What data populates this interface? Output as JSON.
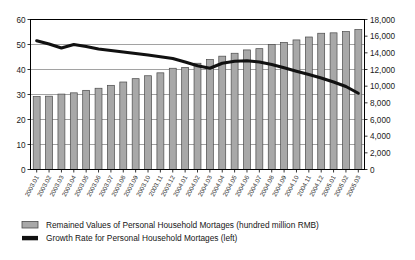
{
  "chart_data": {
    "type": "bar",
    "title": "",
    "subtitle": "",
    "xlabel": "",
    "ylabel": "",
    "grid": true,
    "legend_position": "bottom-left",
    "categories": [
      "2003.01",
      "2003.02",
      "2003.03",
      "2003.04",
      "2003.05",
      "2003.06",
      "2003.07",
      "2003.08",
      "2003.09",
      "2003.10",
      "2003.11",
      "2003.12",
      "2004.01",
      "2004.02",
      "2004.03",
      "2004.04",
      "2004.05",
      "2004.06",
      "2004.07",
      "2004.08",
      "2004.09",
      "2004.10",
      "2004.11",
      "2004.12",
      "2005.01",
      "2005.02",
      "2005.03"
    ],
    "left_axis": {
      "label": "",
      "ticks": [
        "0",
        "10",
        "20",
        "30",
        "40",
        "50",
        "60"
      ],
      "tick_values": [
        0,
        10,
        20,
        30,
        40,
        50,
        60
      ],
      "ylim": [
        0,
        60
      ]
    },
    "right_axis": {
      "label": "",
      "ticks": [
        "0",
        "2,000",
        "4,000",
        "6,000",
        "8,000",
        "10,000",
        "12,000",
        "14,000",
        "16,000",
        "18,000"
      ],
      "tick_values": [
        0,
        2000,
        4000,
        6000,
        8000,
        10000,
        12000,
        14000,
        16000,
        18000
      ],
      "ylim": [
        0,
        18000
      ]
    },
    "series": [
      {
        "name": "Remained Values of Personal Household Mortages (hundred million RMB)",
        "type": "bar",
        "axis": "right",
        "color": "#a8a8a8",
        "edge_color": "#4a4a4a",
        "values": [
          8750,
          8800,
          9050,
          9200,
          9500,
          9750,
          10100,
          10500,
          10900,
          11250,
          11600,
          12150,
          12250,
          12750,
          13200,
          13600,
          13950,
          14350,
          14500,
          15000,
          15250,
          15550,
          15900,
          16350,
          16400,
          16550,
          16800
        ]
      },
      {
        "name": "Growth Rate for Personal Household Mortages (left)",
        "type": "line",
        "axis": "left",
        "color": "#111111",
        "values": [
          51.5,
          50.2,
          48.6,
          50.0,
          49.2,
          48.2,
          47.6,
          47.0,
          46.4,
          45.8,
          45.1,
          44.4,
          43.0,
          41.5,
          40.5,
          42.5,
          43.3,
          43.5,
          43.0,
          42.0,
          40.7,
          39.3,
          38.0,
          36.6,
          35.0,
          33.2,
          30.5
        ]
      }
    ]
  },
  "legend": {
    "items": [
      {
        "label": "Remained Values of Personal Household Mortages (hundred million RMB)",
        "marker": "bar-swatch",
        "color": "#a8a8a8"
      },
      {
        "label": "Growth Rate for Personal Household Mortages (left)",
        "marker": "line-swatch",
        "color": "#111111"
      }
    ]
  }
}
